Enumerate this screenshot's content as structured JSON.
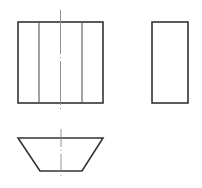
{
  "drawing": {
    "type": "orthographic-projection",
    "views": [
      {
        "name": "front-view",
        "shape": "rectangle",
        "x": 18,
        "y": 22,
        "width": 85,
        "height": 81,
        "inner_lines_x": [
          39,
          82
        ],
        "centerline": {
          "x": 60.5,
          "y1": 10,
          "y2": 111
        }
      },
      {
        "name": "side-view",
        "shape": "rectangle",
        "x": 152,
        "y": 22,
        "width": 36,
        "height": 81
      },
      {
        "name": "top-view",
        "shape": "trapezoid",
        "points": [
          [
            18,
            138
          ],
          [
            103,
            138
          ],
          [
            82,
            171
          ],
          [
            40,
            171
          ]
        ],
        "centerline": {
          "x": 61,
          "y1": 129,
          "y2": 179
        }
      }
    ],
    "colors": {
      "line": "#333333",
      "centerline": "#888888",
      "background": "#ffffff"
    }
  }
}
